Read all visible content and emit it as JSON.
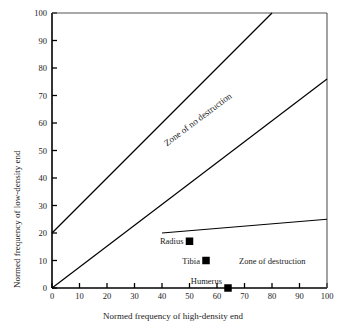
{
  "chart_data": {
    "type": "line",
    "title": "",
    "xlabel": "Normed frequency of high-density end",
    "ylabel": "Normed frequency of low-density end",
    "xlim": [
      0,
      100
    ],
    "ylim": [
      0,
      100
    ],
    "xticks": [
      0,
      10,
      20,
      30,
      40,
      50,
      60,
      70,
      80,
      90,
      100
    ],
    "yticks": [
      0,
      10,
      20,
      30,
      40,
      50,
      60,
      70,
      80,
      90,
      100
    ],
    "grid": false,
    "legend": "none",
    "series": [
      {
        "name": "upper-boundary-line",
        "x": [
          0,
          80
        ],
        "y": [
          20,
          100
        ]
      },
      {
        "name": "middle-boundary-line",
        "x": [
          0,
          100
        ],
        "y": [
          0,
          76
        ]
      },
      {
        "name": "lower-boundary-line",
        "x": [
          40,
          100
        ],
        "y": [
          20,
          25
        ]
      }
    ],
    "points": [
      {
        "label": "Radius",
        "x": 50,
        "y": 17,
        "marker": "square",
        "color": "#000000"
      },
      {
        "label": "Tibia",
        "x": 56,
        "y": 10,
        "marker": "square",
        "color": "#000000"
      },
      {
        "label": "Humerus",
        "x": 64,
        "y": 0,
        "marker": "square",
        "color": "#000000"
      }
    ],
    "annotations": [
      {
        "text": "Zone of no destruction",
        "x": 55,
        "y": 52,
        "rotation": -37
      },
      {
        "text": "Zone of destruction",
        "x": 68,
        "y": 10,
        "rotation": 0
      }
    ],
    "colors": {
      "line": "#000000",
      "axis": "#000000",
      "text": "#1a1a1a",
      "background": "#ffffff"
    }
  }
}
